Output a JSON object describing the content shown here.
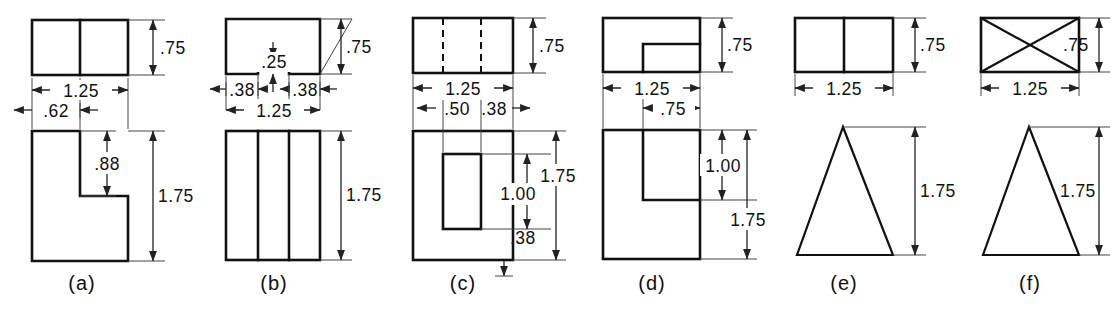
{
  "sheet": {
    "title": "Orthographic multiview exercise figures",
    "background_color": "#ffffff",
    "line_color": "#111111",
    "panel_count": 6
  },
  "panels": [
    {
      "id": "a",
      "caption": "(a)",
      "top_view": {
        "shape": "rectangle-with-vertical-divider",
        "dimensions": [
          "1.25",
          ".75"
        ]
      },
      "front_view": {
        "shape": "L-shape",
        "dimensions": [
          ".62",
          ".88",
          "1.75"
        ]
      },
      "dims": {
        "width": "1.25",
        "height_top": ".75",
        "offset": ".62",
        "step": ".88",
        "height_front": "1.75"
      }
    },
    {
      "id": "b",
      "caption": "(b)",
      "top_view": {
        "shape": "rectangle-with-bottom-notch",
        "dimensions": [
          ".38",
          ".25",
          ".38",
          "1.25",
          ".75"
        ]
      },
      "front_view": {
        "shape": "rectangle-with-two-vertical-lines",
        "dimensions": [
          "1.75"
        ]
      },
      "dims": {
        "left": ".38",
        "notch_depth": ".25",
        "right": ".38",
        "width": "1.25",
        "height_top": ".75",
        "height_front": "1.75"
      }
    },
    {
      "id": "c",
      "caption": "(c)",
      "top_view": {
        "shape": "rectangle-with-two-hidden-lines",
        "dimensions": [
          "1.25",
          ".50",
          ".38",
          ".75"
        ]
      },
      "front_view": {
        "shape": "rectangle-with-inner-rectangle",
        "dimensions": [
          "1.75",
          "1.00",
          ".38"
        ]
      },
      "dims": {
        "width": "1.25",
        "inner_offset": ".50",
        "inner_width": ".38",
        "height_top": ".75",
        "height_front": "1.75",
        "inner_height": "1.00",
        "bottom_margin": ".38"
      }
    },
    {
      "id": "d",
      "caption": "(d)",
      "top_view": {
        "shape": "rectangle-with-inner-step",
        "dimensions": [
          "1.25",
          ".75",
          ".75"
        ]
      },
      "front_view": {
        "shape": "rectangle-with-slot",
        "dimensions": [
          "1.00",
          "1.75"
        ]
      },
      "dims": {
        "width": "1.25",
        "slot_width": ".75",
        "height_top": ".75",
        "slot_height": "1.00",
        "height_front": "1.75"
      }
    },
    {
      "id": "e",
      "caption": "(e)",
      "top_view": {
        "shape": "rectangle-with-vertical-divider",
        "dimensions": [
          "1.25",
          ".75"
        ]
      },
      "front_view": {
        "shape": "triangle",
        "dimensions": [
          "1.75"
        ]
      },
      "dims": {
        "width": "1.25",
        "height_top": ".75",
        "height_front": "1.75"
      }
    },
    {
      "id": "f",
      "caption": "(f)",
      "top_view": {
        "shape": "rectangle-with-diagonals",
        "dimensions": [
          "1.25",
          ".75"
        ]
      },
      "front_view": {
        "shape": "triangle",
        "dimensions": [
          "1.75"
        ]
      },
      "dims": {
        "width": "1.25",
        "height_top": ".75",
        "height_front": "1.75"
      }
    }
  ],
  "labels": {
    "a_width": "1.25",
    "a_height_top": ".75",
    "a_offset": ".62",
    "a_step": ".88",
    "a_height_front": "1.75",
    "a_caption": "(a)",
    "b_left": ".38",
    "b_notch": ".25",
    "b_right": ".38",
    "b_width": "1.25",
    "b_height_top": ".75",
    "b_height_front": "1.75",
    "b_caption": "(b)",
    "c_width": "1.25",
    "c_inner_offset": ".50",
    "c_inner_width": ".38",
    "c_height_top": ".75",
    "c_height_front": "1.75",
    "c_inner_height": "1.00",
    "c_bottom": ".38",
    "c_caption": "(c)",
    "d_width": "1.25",
    "d_slot_width": ".75",
    "d_height_top": ".75",
    "d_slot_height": "1.00",
    "d_height_front": "1.75",
    "d_caption": "(d)",
    "e_width": "1.25",
    "e_height_top": ".75",
    "e_height_front": "1.75",
    "e_caption": "(e)",
    "f_width": "1.25",
    "f_height_top": ".75",
    "f_height_front": "1.75",
    "f_caption": "(f)"
  }
}
